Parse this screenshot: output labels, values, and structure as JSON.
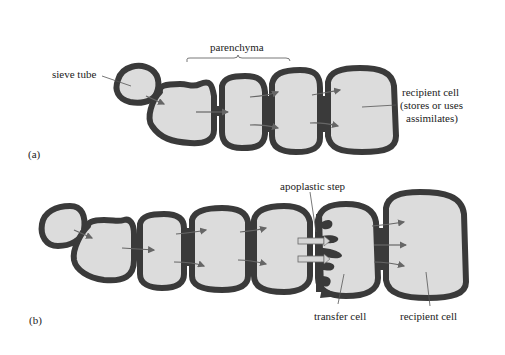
{
  "diagram": {
    "panel_a": {
      "label": "(a)",
      "labels": {
        "sieve_tube": "sieve tube",
        "parenchyma": "parenchyma",
        "recipient_line1": "recipient cell",
        "recipient_line2": "(stores or uses",
        "recipient_line3": "assimilates)"
      }
    },
    "panel_b": {
      "label": "(b)",
      "labels": {
        "apoplastic_step": "apoplastic step",
        "transfer_cell": "transfer cell",
        "recipient_cell": "recipient cell"
      }
    },
    "colors": {
      "cell_fill": "#dcdcdc",
      "cell_wall": "#3a3a3a",
      "background": "#ffffff",
      "arrow": "#666666"
    }
  }
}
